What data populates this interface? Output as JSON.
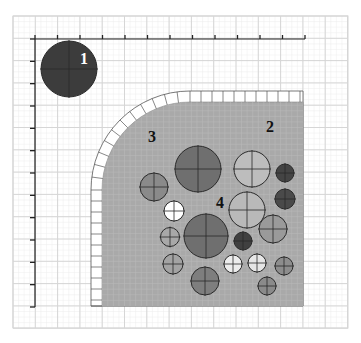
{
  "diagram": {
    "width": 361,
    "height": 343,
    "background": "#ffffff",
    "grid": {
      "x0": 13,
      "y0": 16,
      "x1": 348,
      "y1": 328,
      "step": 22.3,
      "color": "#d6d6d6",
      "minor_color": "#ececec"
    },
    "axes": {
      "origin": [
        35,
        39
      ],
      "x_end": 305,
      "y_end": 307,
      "tick_count_x": 12,
      "tick_count_y": 12,
      "color": "#222222"
    },
    "region": {
      "fill": "#a9a9a9",
      "x": 102,
      "y": 106,
      "right": 303,
      "bottom": 306,
      "corner_center": [
        190,
        190
      ],
      "corner_radius": 88,
      "border_band_width": 11,
      "border_fill": "#ffffff",
      "border_stroke": "#555555"
    },
    "labels": [
      {
        "id": "label-1",
        "text": "1",
        "x": 80,
        "y": 64,
        "color": "#ffffff"
      },
      {
        "id": "label-2",
        "text": "2",
        "x": 266,
        "y": 132,
        "color": "#111111"
      },
      {
        "id": "label-3",
        "text": "3",
        "x": 148,
        "y": 142,
        "color": "#111111"
      },
      {
        "id": "label-4",
        "text": "4",
        "x": 216,
        "y": 208,
        "color": "#111111"
      }
    ],
    "circles": [
      {
        "name": "circle-1",
        "cx": 69,
        "cy": 69,
        "r": 28,
        "fill": "#3c3c3c"
      },
      {
        "name": "circle-a",
        "cx": 198,
        "cy": 169,
        "r": 23,
        "fill": "#6f6f6f"
      },
      {
        "name": "circle-b",
        "cx": 252,
        "cy": 169,
        "r": 18,
        "fill": "#bdbdbd"
      },
      {
        "name": "circle-c",
        "cx": 285,
        "cy": 173,
        "r": 9,
        "fill": "#444444"
      },
      {
        "name": "circle-d",
        "cx": 154,
        "cy": 187,
        "r": 14,
        "fill": "#8a8a8a"
      },
      {
        "name": "circle-e",
        "cx": 285,
        "cy": 199,
        "r": 10,
        "fill": "#4a4a4a"
      },
      {
        "name": "circle-f",
        "cx": 174,
        "cy": 211,
        "r": 10,
        "fill": "#ffffff"
      },
      {
        "name": "circle-g",
        "cx": 247,
        "cy": 210,
        "r": 18,
        "fill": "#b9b9b9"
      },
      {
        "name": "circle-h",
        "cx": 206,
        "cy": 236,
        "r": 22,
        "fill": "#6f6f6f"
      },
      {
        "name": "circle-i",
        "cx": 170,
        "cy": 237,
        "r": 9.5,
        "fill": "#a8a8a8"
      },
      {
        "name": "circle-j",
        "cx": 243,
        "cy": 241,
        "r": 9,
        "fill": "#404040"
      },
      {
        "name": "circle-k",
        "cx": 273,
        "cy": 229,
        "r": 14,
        "fill": "#9a9a9a"
      },
      {
        "name": "circle-l",
        "cx": 173,
        "cy": 264,
        "r": 10,
        "fill": "#a3a3a3"
      },
      {
        "name": "circle-m",
        "cx": 233,
        "cy": 264,
        "r": 9,
        "fill": "#ececec"
      },
      {
        "name": "circle-n",
        "cx": 257,
        "cy": 263,
        "r": 9,
        "fill": "#e6e6e6"
      },
      {
        "name": "circle-o",
        "cx": 284,
        "cy": 266,
        "r": 9,
        "fill": "#8d8d8d"
      },
      {
        "name": "circle-p",
        "cx": 205,
        "cy": 281,
        "r": 14,
        "fill": "#7e7e7e"
      },
      {
        "name": "circle-q",
        "cx": 267,
        "cy": 286,
        "r": 9,
        "fill": "#8a8a8a"
      }
    ]
  }
}
